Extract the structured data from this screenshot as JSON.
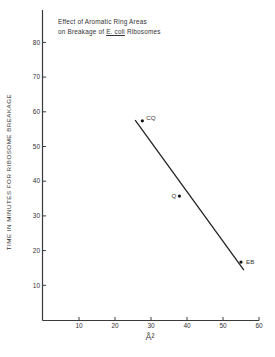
{
  "chart_data": {
    "type": "scatter",
    "title_lines": [
      "Effect of Aromatic Ring Areas",
      "on Breakage of ",
      "E. coli",
      " Ribosomes"
    ],
    "xlabel": "Å²",
    "ylabel": "TIME IN MINUTES FOR RIBOSOME BREAKAGE",
    "xlim": [
      0,
      60
    ],
    "ylim": [
      0,
      88
    ],
    "xticks": [
      10,
      20,
      30,
      40,
      50,
      60
    ],
    "yticks": [
      10,
      20,
      30,
      40,
      50,
      60,
      70,
      80
    ],
    "grid": false,
    "legend": null,
    "points": [
      {
        "label": "CQ",
        "x": 27.6,
        "y": 57.4
      },
      {
        "label": "Q",
        "x": 37.9,
        "y": 35.7
      },
      {
        "label": "EB",
        "x": 55.0,
        "y": 16.7
      }
    ],
    "fit_line": {
      "x": [
        25.6,
        55.8
      ],
      "y": [
        57.6,
        14.4
      ]
    }
  }
}
